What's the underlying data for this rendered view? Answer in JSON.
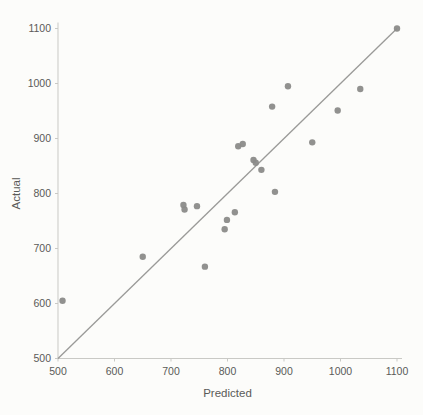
{
  "chart_data": {
    "type": "scatter",
    "title": "",
    "xlabel": "Predicted",
    "ylabel": "Actual",
    "xlim": [
      500,
      1100
    ],
    "ylim": [
      500,
      1100
    ],
    "x_ticks": [
      500,
      600,
      700,
      800,
      900,
      1000,
      1100
    ],
    "y_ticks": [
      500,
      600,
      700,
      800,
      900,
      1000,
      1100
    ],
    "grid": false,
    "legend": "none",
    "points": [
      {
        "predicted": 508,
        "actual": 605
      },
      {
        "predicted": 650,
        "actual": 685
      },
      {
        "predicted": 722,
        "actual": 779
      },
      {
        "predicted": 724,
        "actual": 771
      },
      {
        "predicted": 746,
        "actual": 777
      },
      {
        "predicted": 760,
        "actual": 667
      },
      {
        "predicted": 795,
        "actual": 735
      },
      {
        "predicted": 799,
        "actual": 752
      },
      {
        "predicted": 813,
        "actual": 766
      },
      {
        "predicted": 819,
        "actual": 886
      },
      {
        "predicted": 827,
        "actual": 890
      },
      {
        "predicted": 846,
        "actual": 861
      },
      {
        "predicted": 850,
        "actual": 856
      },
      {
        "predicted": 860,
        "actual": 843
      },
      {
        "predicted": 879,
        "actual": 958
      },
      {
        "predicted": 884,
        "actual": 803
      },
      {
        "predicted": 907,
        "actual": 995
      },
      {
        "predicted": 950,
        "actual": 893
      },
      {
        "predicted": 995,
        "actual": 951
      },
      {
        "predicted": 1035,
        "actual": 990
      },
      {
        "predicted": 1100,
        "actual": 1100
      }
    ],
    "reference_line": {
      "name": "identity-line",
      "from": [
        500,
        500
      ],
      "to": [
        1100,
        1100
      ]
    },
    "colors": {
      "point": "#8b8b89",
      "line": "#9a9a98",
      "axis": "#c9c9c5",
      "text": "#5a5a58",
      "background": "#fcfcfa"
    }
  }
}
